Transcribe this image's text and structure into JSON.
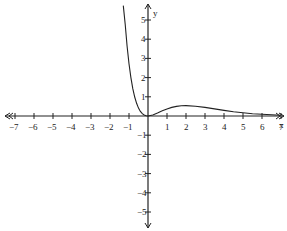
{
  "chart_data": {
    "type": "line",
    "title": "",
    "xlabel": "x",
    "ylabel": "y",
    "xlim": [
      -7,
      7
    ],
    "ylim": [
      -5,
      5
    ],
    "grid": false,
    "x_ticks": [
      -7,
      -6,
      -5,
      -4,
      -3,
      -2,
      -1,
      1,
      2,
      3,
      4,
      5,
      6,
      7
    ],
    "y_ticks": [
      -5,
      -4,
      -3,
      -2,
      -1,
      1,
      2,
      3,
      4,
      5
    ],
    "series": [
      {
        "name": "y = x^2 e^(-x)",
        "x": [
          -1.3,
          -1.2,
          -1.1,
          -1.0,
          -0.9,
          -0.8,
          -0.7,
          -0.6,
          -0.5,
          -0.4,
          -0.3,
          -0.2,
          -0.1,
          0,
          0.25,
          0.5,
          0.75,
          1,
          1.25,
          1.5,
          1.75,
          2,
          2.5,
          3,
          3.5,
          4,
          4.5,
          5,
          5.5,
          6,
          6.5,
          7
        ],
        "values": [
          6.22,
          4.78,
          3.63,
          2.72,
          2.0,
          1.42,
          0.99,
          0.66,
          0.41,
          0.24,
          0.12,
          0.05,
          0.01,
          0,
          0.05,
          0.15,
          0.27,
          0.37,
          0.45,
          0.5,
          0.53,
          0.54,
          0.51,
          0.45,
          0.37,
          0.29,
          0.22,
          0.17,
          0.12,
          0.09,
          0.06,
          0.04
        ]
      }
    ]
  },
  "axes": {
    "x_label": "x",
    "y_label": "y"
  }
}
